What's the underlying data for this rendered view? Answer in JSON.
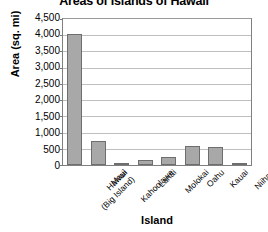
{
  "chart_data": {
    "type": "bar",
    "title": "Areas of Islands of Hawaii",
    "xlabel": "Island",
    "ylabel": "Area (sq. mi)",
    "categories": [
      "Hawaii (Big Island)",
      "Maui",
      "Kahoolawe",
      "Lanai",
      "Molokai",
      "Oahu",
      "Kauai",
      "Niihau"
    ],
    "category_lines": [
      [
        "Hawaii",
        "(Big Island)"
      ],
      [
        "Maui"
      ],
      [
        "Kahoolawe"
      ],
      [
        "Lanai"
      ],
      [
        "Molokai"
      ],
      [
        "Oahu"
      ],
      [
        "Kauai"
      ],
      [
        "Niihau"
      ]
    ],
    "values": [
      4030,
      730,
      45,
      140,
      260,
      600,
      550,
      70
    ],
    "ylim": [
      0,
      4500
    ],
    "ytick_step": 500,
    "ytick_labels": [
      "4,500",
      "4,000",
      "3,500",
      "3,000",
      "2,500",
      "2,000",
      "1,500",
      "1,000",
      "500",
      "0"
    ],
    "grid": true,
    "legend": false,
    "bar_color": "#a8a8a8",
    "bar_border_color": "#6e6e6e",
    "gridline_color": "#bfbfbf",
    "axis_color": "#808080"
  }
}
